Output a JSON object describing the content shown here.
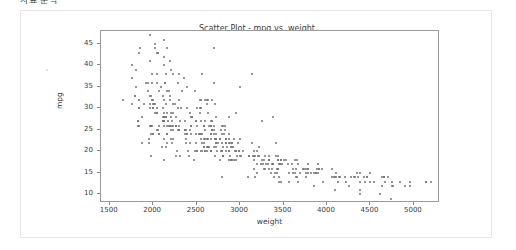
{
  "page": {
    "top_clipped_text": "자료 분석",
    "background_color": "#ffffff",
    "card_border_color": "#e6e6e6"
  },
  "chart_data": {
    "type": "scatter",
    "title": "Scatter Plot - mpg vs. weight",
    "xlabel": "weight",
    "ylabel": "mpg",
    "xlim": [
      1400,
      5300
    ],
    "ylim": [
      8,
      48
    ],
    "xticks": [
      1500,
      2000,
      2500,
      3000,
      3500,
      4000,
      4500,
      5000
    ],
    "yticks": [
      10,
      15,
      20,
      25,
      30,
      35,
      40,
      45
    ],
    "grid": false,
    "legend": null,
    "marker": {
      "color": "#737373",
      "size_px": 2,
      "shape": "circle"
    },
    "n_points": 398,
    "relationship": "negative",
    "points": [
      [
        3504,
        18
      ],
      [
        3693,
        15
      ],
      [
        3436,
        18
      ],
      [
        3433,
        16
      ],
      [
        3449,
        17
      ],
      [
        4341,
        15
      ],
      [
        4354,
        14
      ],
      [
        4312,
        14
      ],
      [
        4425,
        14
      ],
      [
        3850,
        15
      ],
      [
        3563,
        15
      ],
      [
        3609,
        15
      ],
      [
        3761,
        15
      ],
      [
        3086,
        14
      ],
      [
        2372,
        24
      ],
      [
        2833,
        22
      ],
      [
        2774,
        18
      ],
      [
        2587,
        21
      ],
      [
        2130,
        27
      ],
      [
        1835,
        26
      ],
      [
        2672,
        25
      ],
      [
        2430,
        24
      ],
      [
        2375,
        25
      ],
      [
        2234,
        26
      ],
      [
        2648,
        21
      ],
      [
        4615,
        10
      ],
      [
        4376,
        10
      ],
      [
        4382,
        11
      ],
      [
        4732,
        9
      ],
      [
        2130,
        27
      ],
      [
        2264,
        28
      ],
      [
        2228,
        25
      ],
      [
        2046,
        25
      ],
      [
        1978,
        26
      ],
      [
        2634,
        21
      ],
      [
        3439,
        16
      ],
      [
        3329,
        16
      ],
      [
        3302,
        17
      ],
      [
        3288,
        19
      ],
      [
        4209,
        14
      ],
      [
        4464,
        14
      ],
      [
        4154,
        14
      ],
      [
        4096,
        14
      ],
      [
        4955,
        12
      ],
      [
        4746,
        13
      ],
      [
        5140,
        13
      ],
      [
        2962,
        19
      ],
      [
        2408,
        19
      ],
      [
        3282,
        16
      ],
      [
        3664,
        17
      ],
      [
        3102,
        19
      ],
      [
        2875,
        18
      ],
      [
        2901,
        18
      ],
      [
        3336,
        18
      ],
      [
        1950,
        23
      ],
      [
        2451,
        28
      ],
      [
        1836,
        30
      ],
      [
        2542,
        30
      ],
      [
        3781,
        16
      ],
      [
        3632,
        15
      ],
      [
        3613,
        16
      ],
      [
        4141,
        14
      ],
      [
        4699,
        14
      ],
      [
        4457,
        14
      ],
      [
        4638,
        14
      ],
      [
        4257,
        12
      ],
      [
        2219,
        26
      ],
      [
        1963,
        26
      ],
      [
        2125,
        26
      ],
      [
        2300,
        26
      ],
      [
        3430,
        15
      ],
      [
        3158,
        16
      ],
      [
        3643,
        14
      ],
      [
        3655,
        14
      ],
      [
        3955,
        13
      ],
      [
        3470,
        13
      ],
      [
        3850,
        12
      ],
      [
        3563,
        13
      ],
      [
        3170,
        14
      ],
      [
        3445,
        13
      ],
      [
        3443,
        14
      ],
      [
        3197,
        15
      ],
      [
        2671,
        20
      ],
      [
        2594,
        20
      ],
      [
        2702,
        25
      ],
      [
        2220,
        22
      ],
      [
        2223,
        23
      ],
      [
        2789,
        22
      ],
      [
        2587,
        26
      ],
      [
        2711,
        23
      ],
      [
        2542,
        24
      ],
      [
        2434,
        26
      ],
      [
        2265,
        26
      ],
      [
        2110,
        27
      ],
      [
        2800,
        19
      ],
      [
        2506,
        20
      ],
      [
        2001,
        24
      ],
      [
        2070,
        24
      ],
      [
        1978,
        26
      ],
      [
        2190,
        26
      ],
      [
        3330,
        18
      ],
      [
        3476,
        18
      ],
      [
        2833,
        23
      ],
      [
        2774,
        23
      ],
      [
        2587,
        26
      ],
      [
        4096,
        11
      ],
      [
        4955,
        13
      ],
      [
        4746,
        12
      ],
      [
        5140,
        13
      ],
      [
        2130,
        18
      ],
      [
        4654,
        14
      ],
      [
        4499,
        13
      ],
      [
        2789,
        14
      ],
      [
        2279,
        20
      ],
      [
        2401,
        20
      ],
      [
        2379,
        22
      ],
      [
        2124,
        23
      ],
      [
        2310,
        19
      ],
      [
        2472,
        18
      ],
      [
        2265,
        19
      ],
      [
        4082,
        14
      ],
      [
        4278,
        14
      ],
      [
        1867,
        22
      ],
      [
        2158,
        24
      ],
      [
        2582,
        23
      ],
      [
        2868,
        24
      ],
      [
        3399,
        15
      ],
      [
        2660,
        20
      ],
      [
        2807,
        21
      ],
      [
        3664,
        13
      ],
      [
        3102,
        19
      ],
      [
        2875,
        20
      ],
      [
        2901,
        18
      ],
      [
        3336,
        18
      ],
      [
        1950,
        22
      ],
      [
        2451,
        28
      ],
      [
        1836,
        30
      ],
      [
        2542,
        29
      ],
      [
        3781,
        16
      ],
      [
        3632,
        18
      ],
      [
        2155,
        22
      ],
      [
        2565,
        24
      ],
      [
        3150,
        19
      ],
      [
        2565,
        22
      ],
      [
        3940,
        16
      ],
      [
        3270,
        16
      ],
      [
        2930,
        18
      ],
      [
        3820,
        15
      ],
      [
        4380,
        15
      ],
      [
        4055,
        16
      ],
      [
        3870,
        15
      ],
      [
        3755,
        14
      ],
      [
        2045,
        29
      ],
      [
        2155,
        24
      ],
      [
        1825,
        26
      ],
      [
        2300,
        25
      ],
      [
        1795,
        33
      ],
      [
        2485,
        20
      ],
      [
        2910,
        18
      ],
      [
        1975,
        19
      ],
      [
        2100,
        21
      ],
      [
        2150,
        21
      ],
      [
        1825,
        27
      ],
      [
        2725,
        22
      ],
      [
        2585,
        22
      ],
      [
        2835,
        20
      ],
      [
        2665,
        26
      ],
      [
        2370,
        25
      ],
      [
        2950,
        18
      ],
      [
        2790,
        20
      ],
      [
        2930,
        23
      ],
      [
        2695,
        26
      ],
      [
        2875,
        22
      ],
      [
        2420,
        29
      ],
      [
        2905,
        22
      ],
      [
        2230,
        31
      ],
      [
        2525,
        24
      ],
      [
        2735,
        20
      ],
      [
        3160,
        18
      ],
      [
        3465,
        17
      ],
      [
        2125,
        28
      ],
      [
        2205,
        25
      ],
      [
        2205,
        23
      ],
      [
        1825,
        27
      ],
      [
        3245,
        17
      ],
      [
        2990,
        20
      ],
      [
        3365,
        17
      ],
      [
        2885,
        19
      ],
      [
        3360,
        15
      ],
      [
        3385,
        14
      ],
      [
        3370,
        16
      ],
      [
        3320,
        17
      ],
      [
        2950,
        20
      ],
      [
        3250,
        18
      ],
      [
        2710,
        19
      ],
      [
        2750,
        22
      ],
      [
        2420,
        25
      ],
      [
        3190,
        17
      ],
      [
        2500,
        26
      ],
      [
        2045,
        29
      ],
      [
        2155,
        29
      ],
      [
        1890,
        31
      ],
      [
        1795,
        33
      ],
      [
        2725,
        21
      ],
      [
        2375,
        23
      ],
      [
        2145,
        28
      ],
      [
        1835,
        32
      ],
      [
        2800,
        19
      ],
      [
        2425,
        22
      ],
      [
        2775,
        20
      ],
      [
        2310,
        27
      ],
      [
        2155,
        26
      ],
      [
        2670,
        23
      ],
      [
        2595,
        20
      ],
      [
        2700,
        21
      ],
      [
        2556,
        24
      ],
      [
        2144,
        31
      ],
      [
        1968,
        30
      ],
      [
        2120,
        32
      ],
      [
        2019,
        29
      ],
      [
        2678,
        25
      ],
      [
        2870,
        20
      ],
      [
        3003,
        19
      ],
      [
        3381,
        17
      ],
      [
        2188,
        26
      ],
      [
        2711,
        23
      ],
      [
        2542,
        24
      ],
      [
        2434,
        26
      ],
      [
        2265,
        26
      ],
      [
        2110,
        27
      ],
      [
        2800,
        19
      ],
      [
        2506,
        20
      ],
      [
        2001,
        24
      ],
      [
        2070,
        24
      ],
      [
        1978,
        26
      ],
      [
        2190,
        26
      ],
      [
        3330,
        18
      ],
      [
        3476,
        18
      ],
      [
        2833,
        23
      ],
      [
        2774,
        23
      ],
      [
        2587,
        26
      ],
      [
        2545,
        20
      ],
      [
        2565,
        20
      ],
      [
        2300,
        25
      ],
      [
        2205,
        28
      ],
      [
        1649,
        32
      ],
      [
        2003,
        31
      ],
      [
        2125,
        29
      ],
      [
        2108,
        28
      ],
      [
        2246,
        31
      ],
      [
        2489,
        27
      ],
      [
        2391,
        30
      ],
      [
        2000,
        30
      ],
      [
        3264,
        17
      ],
      [
        3459,
        17
      ],
      [
        3432,
        18
      ],
      [
        3158,
        19
      ],
      [
        4668,
        13
      ],
      [
        4440,
        13
      ],
      [
        4498,
        15
      ],
      [
        4657,
        14
      ],
      [
        3907,
        16
      ],
      [
        3897,
        17
      ],
      [
        3730,
        16
      ],
      [
        3785,
        15
      ],
      [
        3039,
        20
      ],
      [
        3221,
        19
      ],
      [
        3169,
        19
      ],
      [
        2171,
        27
      ],
      [
        2639,
        26
      ],
      [
        2914,
        21
      ],
      [
        2592,
        23
      ],
      [
        2702,
        24
      ],
      [
        2223,
        29
      ],
      [
        2545,
        23
      ],
      [
        2984,
        20
      ],
      [
        1937,
        36
      ],
      [
        3211,
        19
      ],
      [
        2490,
        22
      ],
      [
        2635,
        21
      ],
      [
        2620,
        20
      ],
      [
        2725,
        22
      ],
      [
        2385,
        24
      ],
      [
        1755,
        37
      ],
      [
        1875,
        28
      ],
      [
        1760,
        31
      ],
      [
        2065,
        26
      ],
      [
        1975,
        24
      ],
      [
        2050,
        25
      ],
      [
        1985,
        26
      ],
      [
        2215,
        27
      ],
      [
        2045,
        30
      ],
      [
        1965,
        33
      ],
      [
        1995,
        30
      ],
      [
        2945,
        20
      ],
      [
        3015,
        19
      ],
      [
        2585,
        21
      ],
      [
        2835,
        22
      ],
      [
        2665,
        20
      ],
      [
        2370,
        25
      ],
      [
        2950,
        20
      ],
      [
        2790,
        20
      ],
      [
        2290,
        25
      ],
      [
        2490,
        24
      ],
      [
        2635,
        23
      ],
      [
        2625,
        21
      ],
      [
        2720,
        23
      ],
      [
        2385,
        24
      ],
      [
        3420,
        16
      ],
      [
        3905,
        16
      ],
      [
        3380,
        17
      ],
      [
        3785,
        17
      ],
      [
        3550,
        17
      ],
      [
        3645,
        16
      ],
      [
        2855,
        21
      ],
      [
        2880,
        22
      ],
      [
        2660,
        24
      ],
      [
        2975,
        22
      ],
      [
        2295,
        25
      ],
      [
        2625,
        23
      ],
      [
        2720,
        24
      ],
      [
        1985,
        36
      ],
      [
        2040,
        36
      ],
      [
        2155,
        34
      ],
      [
        2560,
        38
      ],
      [
        2300,
        32
      ],
      [
        2230,
        38
      ],
      [
        2830,
        25
      ],
      [
        3140,
        38
      ],
      [
        2795,
        26
      ],
      [
        3410,
        22
      ],
      [
        1990,
        32
      ],
      [
        2135,
        36
      ],
      [
        2670,
        27
      ],
      [
        2595,
        27
      ],
      [
        2700,
        44
      ],
      [
        2556,
        32
      ],
      [
        2144,
        28
      ],
      [
        1968,
        31
      ],
      [
        2120,
        28
      ],
      [
        2019,
        31
      ],
      [
        2678,
        32
      ],
      [
        2870,
        28
      ],
      [
        3003,
        35
      ],
      [
        3381,
        28
      ],
      [
        2188,
        34
      ],
      [
        2711,
        31
      ],
      [
        2542,
        32
      ],
      [
        2434,
        28
      ],
      [
        2265,
        26
      ],
      [
        2110,
        30
      ],
      [
        2800,
        26
      ],
      [
        2506,
        30
      ],
      [
        2001,
        32
      ],
      [
        2070,
        34
      ],
      [
        1978,
        33
      ],
      [
        2190,
        32
      ],
      [
        1800,
        35
      ],
      [
        1915,
        36
      ],
      [
        2190,
        33
      ],
      [
        2815,
        24
      ],
      [
        2600,
        25
      ],
      [
        2720,
        23
      ],
      [
        1800,
        39
      ],
      [
        1760,
        40
      ],
      [
        2085,
        35
      ],
      [
        2335,
        34
      ],
      [
        2950,
        29
      ],
      [
        3250,
        27
      ],
      [
        1850,
        44
      ],
      [
        1835,
        43
      ],
      [
        2045,
        43
      ],
      [
        2635,
        32
      ],
      [
        2830,
        26
      ],
      [
        3140,
        22
      ],
      [
        2795,
        24
      ],
      [
        3410,
        19
      ],
      [
        1990,
        38
      ],
      [
        2135,
        36
      ],
      [
        2670,
        26
      ],
      [
        2595,
        32
      ],
      [
        2700,
        36
      ],
      [
        2556,
        30
      ],
      [
        2144,
        38
      ],
      [
        1968,
        41
      ],
      [
        2120,
        46
      ],
      [
        2019,
        44
      ],
      [
        2678,
        27
      ],
      [
        2870,
        23
      ],
      [
        2905,
        22
      ],
      [
        2290,
        30
      ],
      [
        2490,
        27
      ],
      [
        2635,
        29
      ],
      [
        2625,
        31
      ],
      [
        2720,
        28
      ],
      [
        2385,
        35
      ],
      [
        2045,
        38
      ],
      [
        2155,
        44
      ],
      [
        2290,
        36
      ],
      [
        2625,
        32
      ],
      [
        1965,
        47
      ],
      [
        2050,
        43
      ],
      [
        2125,
        40
      ],
      [
        2210,
        39
      ],
      [
        2350,
        37
      ],
      [
        2480,
        34
      ],
      [
        2190,
        41
      ],
      [
        2020,
        45
      ],
      [
        2295,
        38
      ],
      [
        2130,
        42
      ],
      [
        3530,
        18
      ],
      [
        3900,
        15
      ],
      [
        3725,
        16
      ],
      [
        4100,
        14
      ],
      [
        4385,
        13
      ],
      [
        4635,
        12
      ],
      [
        4900,
        12
      ],
      [
        5200,
        13
      ],
      [
        4840,
        13
      ],
      [
        4220,
        13
      ],
      [
        3600,
        17
      ],
      [
        3330,
        19
      ],
      [
        3155,
        20
      ],
      [
        2910,
        21
      ],
      [
        3755,
        16
      ],
      [
        3870,
        15
      ],
      [
        4054,
        14
      ],
      [
        4129,
        13
      ],
      [
        3270,
        18
      ],
      [
        3480,
        17
      ],
      [
        2900,
        21
      ],
      [
        3190,
        20
      ],
      [
        2665,
        24
      ],
      [
        2370,
        27
      ],
      [
        2200,
        29
      ],
      [
        2005,
        31
      ],
      [
        1940,
        34
      ],
      [
        2110,
        33
      ],
      [
        2320,
        30
      ],
      [
        2555,
        27
      ],
      [
        2780,
        25
      ],
      [
        3000,
        23
      ],
      [
        3220,
        21
      ],
      [
        3440,
        19
      ],
      [
        3660,
        18
      ],
      [
        3880,
        16
      ],
      [
        4100,
        15
      ],
      [
        4320,
        14
      ],
      [
        4540,
        13
      ],
      [
        4760,
        12
      ]
    ]
  }
}
